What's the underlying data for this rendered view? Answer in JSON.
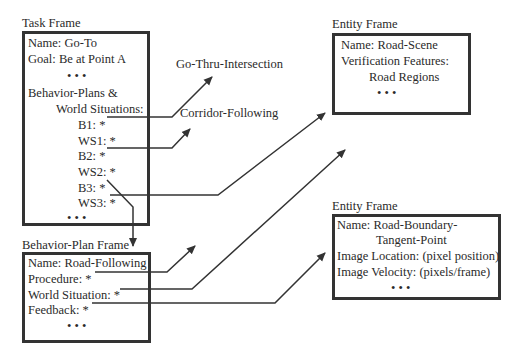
{
  "task_frame": {
    "title": "Task Frame",
    "name": "Name:  Go-To",
    "goal": "Goal:  Be at Point A",
    "dots1": "•   •   •",
    "bp_header1": "Behavior-Plans &",
    "bp_header2": "World Situations:",
    "b1": "B1: *",
    "ws1": "WS1: *",
    "b2": "B2: *",
    "ws2": "WS2: *",
    "b3": "B3: *",
    "ws3": "WS3: *",
    "dots2": "•   •   •"
  },
  "behavior_plan_frame": {
    "title": "Behavior-Plan Frame",
    "name": "Name:  Road-Following",
    "procedure": "Procedure:  *",
    "world_situation": "World Situation:  *",
    "feedback": "Feedback:  *",
    "dots": "•   •   •"
  },
  "entity_frame_1": {
    "title": "Entity Frame",
    "name": "Name:  Road-Scene",
    "verification": "Verification Features:",
    "regions": "Road Regions",
    "dots": "•   •   •"
  },
  "entity_frame_2": {
    "title": "Entity Frame",
    "name1": "Name:  Road-Boundary-",
    "name2": "Tangent-Point",
    "location": "Image Location: (pixel position)",
    "velocity": "Image Velocity: (pixels/frame)",
    "dots": "•   •   •"
  },
  "targets": {
    "go_thru": "Go-Thru-Intersection",
    "corridor": "Corridor-Following"
  }
}
